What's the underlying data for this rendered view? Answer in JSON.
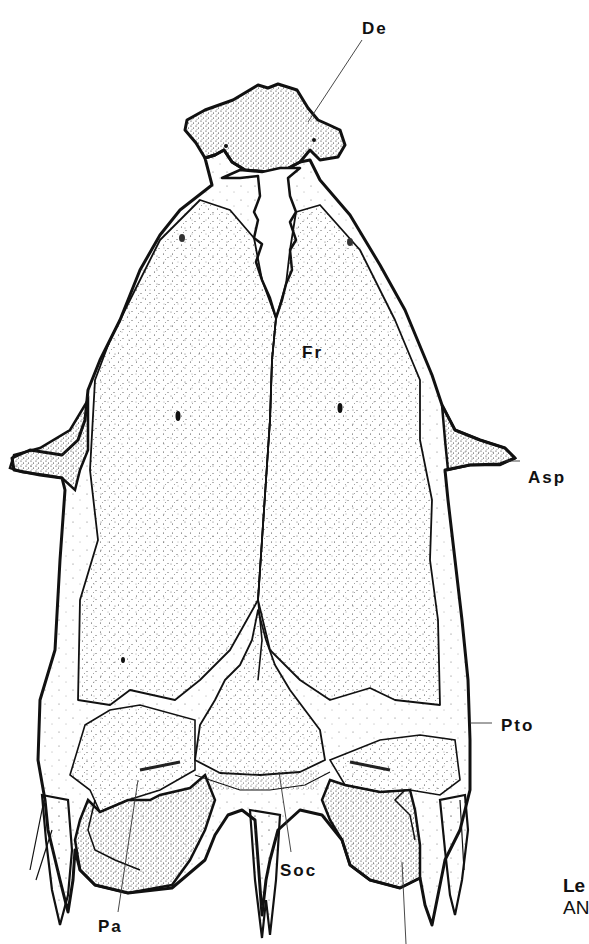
{
  "figure": {
    "colors": {
      "ink": "#111111",
      "stipple": "#2a2a2a",
      "background": "#ffffff"
    }
  },
  "labels": [
    {
      "id": "de",
      "text": "De"
    },
    {
      "id": "fr",
      "text": "Fr"
    },
    {
      "id": "asp",
      "text": "Asp"
    },
    {
      "id": "pto",
      "text": "Pto"
    },
    {
      "id": "soc",
      "text": "Soc"
    },
    {
      "id": "pa",
      "text": "Pa"
    }
  ],
  "caption": {
    "line1": "Le",
    "line2": "AN"
  }
}
